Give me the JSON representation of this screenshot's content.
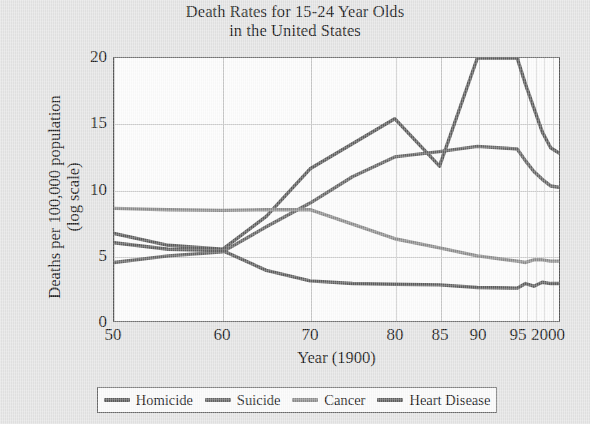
{
  "chart_data": {
    "type": "line",
    "title": "Death Rates for 15-24 Year Olds in the United States",
    "title_line1": "Death Rates for 15-24 Year Olds",
    "title_line2": "in the United States",
    "xlabel": "Year (1900)",
    "ylabel": "Deaths per 100,000 population",
    "ylabel_line1": "Deaths per 100,000 population",
    "ylabel_line2": "(log scale)",
    "yscale_note": "(log scale)",
    "grid": true,
    "legend_position": "bottom",
    "ylim": [
      0,
      20
    ],
    "yticks": [
      0,
      5,
      10,
      15,
      20
    ],
    "ytick_labels": [
      "0",
      "5",
      "10",
      "15",
      "20"
    ],
    "xtick_labels": [
      "50",
      "60",
      "70",
      "80",
      "85",
      "90",
      "95",
      "2000"
    ],
    "xtick_positions": [
      50,
      60,
      70,
      80,
      85,
      90,
      95,
      100
    ],
    "x": [
      50,
      55,
      60,
      65,
      70,
      75,
      80,
      85,
      90,
      95,
      96,
      97,
      98,
      99,
      100
    ],
    "series": [
      {
        "name": "Homicide",
        "color": "#5d5d5d",
        "values": [
          6.7,
          5.8,
          5.5,
          8.0,
          11.6,
          13.5,
          15.4,
          11.8,
          20.0,
          20.0,
          18.0,
          16.2,
          14.4,
          13.2,
          12.8
        ]
      },
      {
        "name": "Suicide",
        "color": "#666666",
        "values": [
          4.5,
          5.0,
          5.3,
          7.2,
          9.0,
          11.0,
          12.5,
          12.9,
          13.3,
          13.1,
          12.2,
          11.4,
          10.8,
          10.3,
          10.2
        ]
      },
      {
        "name": "Cancer",
        "color": "#8d8d8d",
        "values": [
          8.6,
          8.5,
          8.45,
          8.5,
          8.5,
          7.4,
          6.3,
          5.6,
          5.0,
          4.6,
          4.5,
          4.7,
          4.7,
          4.6,
          4.6
        ]
      },
      {
        "name": "Heart Disease",
        "color": "#5f5f5f",
        "values": [
          6.0,
          5.5,
          5.4,
          3.9,
          3.1,
          2.9,
          2.85,
          2.8,
          2.6,
          2.55,
          2.9,
          2.7,
          3.0,
          2.9,
          2.9
        ]
      }
    ]
  },
  "legend": {
    "items": [
      {
        "label": "Homicide",
        "color": "#5d5d5d"
      },
      {
        "label": "Suicide",
        "color": "#666666"
      },
      {
        "label": "Cancer",
        "color": "#8d8d8d"
      },
      {
        "label": "Heart Disease",
        "color": "#5f5f5f"
      }
    ]
  }
}
